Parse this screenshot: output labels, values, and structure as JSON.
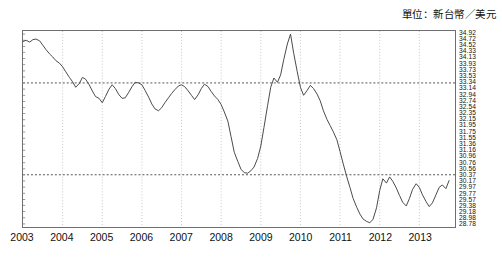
{
  "unit_caption": "單位：新台幣／美元",
  "chart_data": {
    "type": "line",
    "title": "",
    "subtitle": "",
    "xlabel": "",
    "ylabel": "",
    "unit_label": "單位：新台幣／美元",
    "grid": true,
    "legend": "none",
    "line_color": "#4a4a4a",
    "grid_color": "#c8c8c8",
    "frame_color": "#6f6f6f",
    "xlim": [
      2003.0,
      2013.9
    ],
    "ylim": [
      28.68,
      35.02
    ],
    "xtick_labels": [
      "2003",
      "2004",
      "2005",
      "2006",
      "2007",
      "2008",
      "2009",
      "2010",
      "2011",
      "2012",
      "2013"
    ],
    "xtick_values": [
      2003,
      2004,
      2005,
      2006,
      2007,
      2008,
      2009,
      2010,
      2011,
      2012,
      2013
    ],
    "ytick_labels": [
      "34.92",
      "34.72",
      "34.52",
      "34.33",
      "34.13",
      "33.93",
      "33.73",
      "33.53",
      "33.34",
      "33.14",
      "32.94",
      "32.74",
      "32.54",
      "32.35",
      "32.15",
      "31.95",
      "31.75",
      "31.55",
      "31.36",
      "31.16",
      "30.96",
      "30.76",
      "30.56",
      "30.37",
      "30.17",
      "29.97",
      "29.77",
      "29.57",
      "29.38",
      "29.18",
      "28.98",
      "28.78"
    ],
    "ytick_values": [
      34.92,
      34.72,
      34.52,
      34.33,
      34.13,
      33.93,
      33.73,
      33.53,
      33.34,
      33.14,
      32.94,
      32.74,
      32.54,
      32.35,
      32.15,
      31.95,
      31.75,
      31.55,
      31.36,
      31.16,
      30.96,
      30.76,
      30.56,
      30.37,
      30.17,
      29.97,
      29.77,
      29.57,
      29.38,
      29.18,
      28.98,
      28.78
    ],
    "hgrid_values": [
      33.34,
      30.37
    ],
    "vgrid_values": [
      2004,
      2005,
      2006,
      2007,
      2008,
      2009,
      2010,
      2011,
      2012,
      2013
    ],
    "series": [
      {
        "name": "TWD/USD",
        "x": [
          2003.0,
          2003.08,
          2003.17,
          2003.25,
          2003.33,
          2003.42,
          2003.5,
          2003.58,
          2003.67,
          2003.75,
          2003.83,
          2003.92,
          2004.0,
          2004.08,
          2004.17,
          2004.25,
          2004.33,
          2004.42,
          2004.5,
          2004.58,
          2004.67,
          2004.75,
          2004.83,
          2004.92,
          2005.0,
          2005.08,
          2005.17,
          2005.25,
          2005.33,
          2005.42,
          2005.5,
          2005.58,
          2005.67,
          2005.75,
          2005.83,
          2005.92,
          2006.0,
          2006.08,
          2006.17,
          2006.25,
          2006.33,
          2006.42,
          2006.5,
          2006.58,
          2006.67,
          2006.75,
          2006.83,
          2006.92,
          2007.0,
          2007.08,
          2007.17,
          2007.25,
          2007.33,
          2007.42,
          2007.5,
          2007.58,
          2007.67,
          2007.75,
          2007.83,
          2007.92,
          2008.0,
          2008.08,
          2008.17,
          2008.25,
          2008.33,
          2008.42,
          2008.5,
          2008.58,
          2008.67,
          2008.75,
          2008.83,
          2008.92,
          2009.0,
          2009.08,
          2009.17,
          2009.25,
          2009.33,
          2009.42,
          2009.5,
          2009.58,
          2009.67,
          2009.75,
          2009.83,
          2009.92,
          2010.0,
          2010.08,
          2010.17,
          2010.25,
          2010.33,
          2010.42,
          2010.5,
          2010.58,
          2010.67,
          2010.75,
          2010.83,
          2010.92,
          2011.0,
          2011.08,
          2011.17,
          2011.25,
          2011.33,
          2011.42,
          2011.5,
          2011.58,
          2011.67,
          2011.75,
          2011.83,
          2011.92,
          2012.0,
          2012.08,
          2012.17,
          2012.25,
          2012.33,
          2012.42,
          2012.5,
          2012.58,
          2012.67,
          2012.75,
          2012.83,
          2012.92,
          2013.0,
          2013.08,
          2013.17,
          2013.25,
          2013.33,
          2013.42,
          2013.5,
          2013.58,
          2013.67,
          2013.75
        ],
        "values": [
          34.68,
          34.72,
          34.66,
          34.74,
          34.76,
          34.7,
          34.56,
          34.42,
          34.28,
          34.18,
          34.06,
          33.98,
          33.86,
          33.7,
          33.52,
          33.38,
          33.2,
          33.32,
          33.52,
          33.46,
          33.28,
          33.08,
          32.9,
          32.84,
          32.7,
          32.9,
          33.14,
          33.28,
          33.16,
          32.96,
          32.84,
          32.86,
          33.04,
          33.22,
          33.36,
          33.34,
          33.28,
          33.1,
          32.88,
          32.66,
          32.5,
          32.44,
          32.54,
          32.7,
          32.86,
          33.0,
          33.12,
          33.24,
          33.28,
          33.22,
          33.08,
          32.94,
          32.8,
          32.96,
          33.16,
          33.3,
          33.22,
          33.06,
          32.92,
          32.8,
          32.64,
          32.4,
          32.1,
          31.6,
          31.1,
          30.8,
          30.55,
          30.44,
          30.42,
          30.5,
          30.62,
          30.9,
          31.3,
          31.9,
          32.6,
          33.2,
          33.5,
          33.36,
          33.6,
          34.1,
          34.6,
          34.92,
          34.3,
          33.7,
          33.2,
          32.94,
          33.1,
          33.26,
          33.16,
          32.98,
          32.76,
          32.44,
          32.16,
          31.96,
          31.76,
          31.5,
          31.12,
          30.72,
          30.3,
          29.96,
          29.6,
          29.32,
          29.1,
          28.94,
          28.86,
          28.82,
          28.92,
          29.3,
          29.86,
          30.24,
          30.1,
          30.3,
          30.16,
          29.94,
          29.7,
          29.48,
          29.36,
          29.6,
          29.9,
          30.08,
          29.96,
          29.72,
          29.5,
          29.34,
          29.46,
          29.72,
          29.96,
          30.04,
          29.92,
          30.18
        ]
      }
    ]
  }
}
